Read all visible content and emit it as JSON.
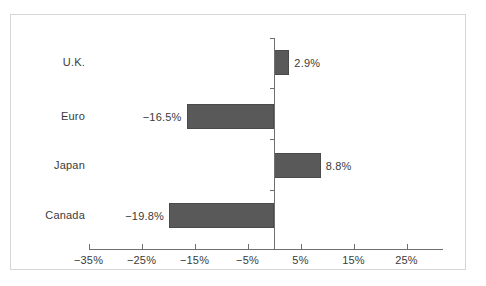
{
  "chart_data": {
    "type": "bar",
    "orientation": "horizontal",
    "title": "",
    "subtitle": "",
    "xlabel": "",
    "ylabel": "",
    "categories": [
      "U.K.",
      "Euro",
      "Japan",
      "Canada"
    ],
    "values": [
      2.9,
      -16.5,
      8.8,
      -19.8
    ],
    "value_labels": [
      "2.9%",
      "−16.5%",
      "8.8%",
      "−19.8%"
    ],
    "xlim": [
      -38,
      28
    ],
    "xticks": [
      -35,
      -25,
      -15,
      -5,
      5,
      15,
      25
    ],
    "xtick_labels": [
      "−35%",
      "−25%",
      "−15%",
      "−5%",
      "5%",
      "15%",
      "25%"
    ],
    "grid": false,
    "legend": "none",
    "bar_color": "#595959",
    "axis_color": "#6f6f6f",
    "text_color": "#3b3b3b",
    "frame_color": "#d6d6d6",
    "background_color": "#ffffff"
  },
  "axis": {
    "zero_line_label": "zero-axis"
  }
}
